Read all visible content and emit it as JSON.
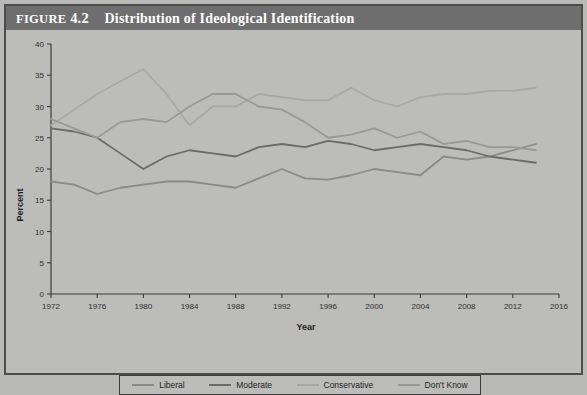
{
  "figure": {
    "label": "FIGURE",
    "number": "4.2",
    "caption": "Distribution of Ideological Identification",
    "title_full": "FIGURE 4.2  Distribution of Ideological Identification",
    "banner_color": "#6e6e6e",
    "background_color": "#bcbcba",
    "frame_color": "#4c4c4c"
  },
  "chart_data": {
    "type": "line",
    "title": "Distribution of Ideological Identification",
    "xlabel": "Year",
    "ylabel": "Percent",
    "xlim": [
      1972,
      2016
    ],
    "ylim": [
      0,
      40
    ],
    "xticks": [
      1972,
      1976,
      1980,
      1984,
      1988,
      1992,
      1996,
      2000,
      2004,
      2008,
      2012,
      2016
    ],
    "yticks": [
      0,
      5,
      10,
      15,
      20,
      25,
      30,
      35,
      40
    ],
    "grid": false,
    "legend_position": "bottom",
    "x": [
      1972,
      1974,
      1976,
      1978,
      1980,
      1982,
      1984,
      1986,
      1988,
      1990,
      1992,
      1994,
      1996,
      1998,
      2000,
      2002,
      2004,
      2006,
      2008,
      2010,
      2012,
      2014
    ],
    "series": [
      {
        "name": "Liberal",
        "color": "#8a8a88",
        "values": [
          18.0,
          17.5,
          16.0,
          17.0,
          17.5,
          18.0,
          18.0,
          17.5,
          17.0,
          18.5,
          20.0,
          18.5,
          18.3,
          19.0,
          20.0,
          19.5,
          19.0,
          22.0,
          21.5,
          22.0,
          23.0,
          24.0
        ]
      },
      {
        "name": "Moderate",
        "color": "#6b6b69",
        "values": [
          26.5,
          26.0,
          25.0,
          22.5,
          20.0,
          22.0,
          23.0,
          22.5,
          22.0,
          23.5,
          24.0,
          23.5,
          24.5,
          24.0,
          23.0,
          23.5,
          24.0,
          23.5,
          23.0,
          22.0,
          21.5,
          21.0
        ]
      },
      {
        "name": "Conservative",
        "color": "#a8a8a6",
        "values": [
          27.0,
          29.5,
          32.0,
          34.0,
          36.0,
          32.0,
          27.0,
          30.0,
          30.0,
          32.0,
          31.5,
          31.0,
          31.0,
          33.0,
          31.0,
          30.0,
          31.5,
          32.0,
          32.0,
          32.5,
          32.5,
          33.0
        ]
      },
      {
        "name": "Don't Know",
        "color": "#989896",
        "values": [
          28.0,
          26.5,
          25.0,
          27.5,
          28.0,
          27.5,
          30.0,
          32.0,
          32.0,
          30.0,
          29.5,
          27.5,
          25.0,
          25.5,
          26.5,
          25.0,
          26.0,
          24.0,
          24.5,
          23.5,
          23.5,
          23.0
        ]
      }
    ]
  },
  "legend": {
    "items": [
      {
        "label": "Liberal",
        "color": "#8a8a88"
      },
      {
        "label": "Moderate",
        "color": "#6b6b69"
      },
      {
        "label": "Conservative",
        "color": "#a8a8a6"
      },
      {
        "label": "Don't Know",
        "color": "#989896"
      }
    ]
  }
}
